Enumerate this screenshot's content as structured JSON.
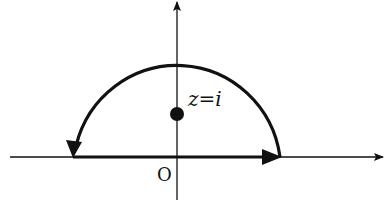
{
  "diagram": {
    "type": "contour-integral",
    "labels": {
      "pole": "z=i",
      "origin": "O"
    },
    "colors": {
      "stroke": "#111111",
      "background": "#ffffff"
    },
    "elements": [
      {
        "name": "real-axis",
        "kind": "axis",
        "direction": "right"
      },
      {
        "name": "imaginary-axis",
        "kind": "axis",
        "direction": "up"
      },
      {
        "name": "contour-real-segment",
        "kind": "path",
        "direction": "left-to-right"
      },
      {
        "name": "contour-semicircle",
        "kind": "path",
        "direction": "counterclockwise"
      },
      {
        "name": "pole-point",
        "kind": "point",
        "label": "z=i"
      }
    ]
  }
}
